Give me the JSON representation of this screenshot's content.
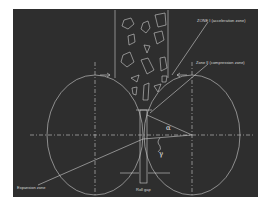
{
  "diagram": {
    "labels": {
      "zone1": "ZONE I (acceleration zone)",
      "zone2": "Zone II (compression zone)",
      "expansion": "Expansion zone",
      "roll_gap": "Roll gap",
      "alpha": "α",
      "gamma": "γ"
    },
    "colors": {
      "background": "#2e2e2e",
      "line": "#d0d0d0",
      "page": "#ffffff"
    }
  }
}
